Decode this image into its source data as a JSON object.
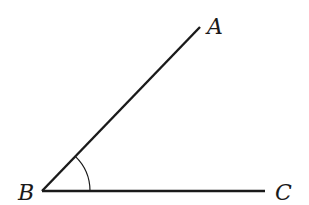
{
  "diagram": {
    "labels": {
      "A": "A",
      "B": "B",
      "C": "C"
    },
    "points": {
      "A": [
        200,
        27
      ],
      "B": [
        42,
        191
      ],
      "C": [
        265,
        191
      ]
    },
    "angle_arc": {
      "vertex": "B",
      "radius": 48
    },
    "stroke_color": "#1a1a1a"
  }
}
